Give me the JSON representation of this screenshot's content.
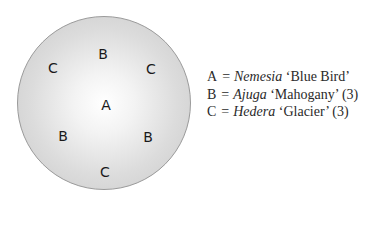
{
  "diagram": {
    "container": {
      "shape": "circle",
      "fill_center": "#ffffff",
      "fill_edge": "#c8c8c8",
      "border": "#9a9a9a"
    },
    "plants": [
      {
        "label": "B",
        "x": 103,
        "y": 54
      },
      {
        "label": "C",
        "x": 53,
        "y": 68
      },
      {
        "label": "C",
        "x": 151,
        "y": 69
      },
      {
        "label": "A",
        "x": 106,
        "y": 105
      },
      {
        "label": "B",
        "x": 63,
        "y": 136
      },
      {
        "label": "B",
        "x": 148,
        "y": 137
      },
      {
        "label": "C",
        "x": 105,
        "y": 172
      }
    ]
  },
  "legend": [
    {
      "key": "A",
      "equals": "=",
      "genus": "Nemesia",
      "cultivar": "‘Blue Bird’",
      "qty": ""
    },
    {
      "key": "B",
      "equals": "=",
      "genus": "Ajuga",
      "cultivar": "‘Mahogany’",
      "qty": "(3)"
    },
    {
      "key": "C",
      "equals": "=",
      "genus": "Hedera",
      "cultivar": "‘Glacier’",
      "qty": "(3)"
    }
  ]
}
